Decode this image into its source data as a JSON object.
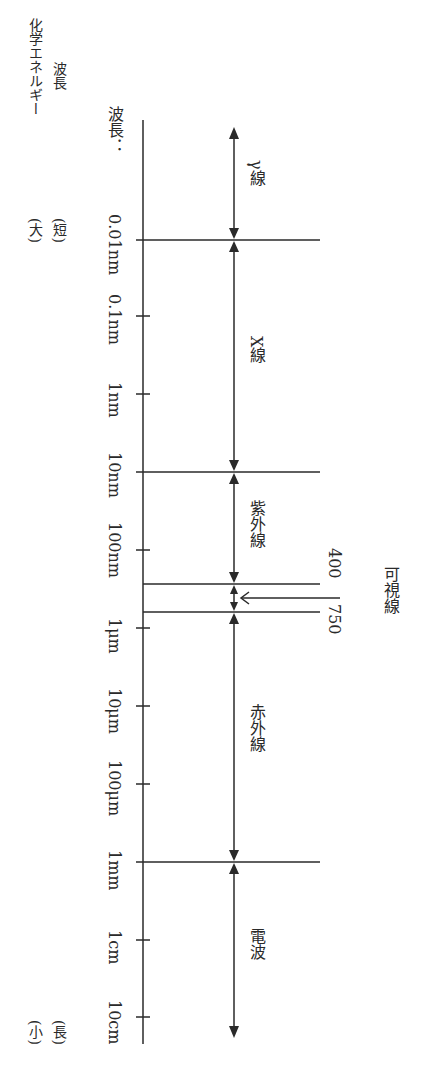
{
  "legend": {
    "line1": "波長",
    "line2": "化学エネルギー",
    "short_label": "(短)",
    "large_label": "(大)",
    "long_label": "(長)",
    "small_label": "(小)"
  },
  "axis": {
    "title": "波長：",
    "ticks": [
      {
        "label": "0.01nm",
        "y": 240
      },
      {
        "label": "0.1nm",
        "y": 316
      },
      {
        "label": "1nm",
        "y": 394
      },
      {
        "label": "10nm",
        "y": 472
      },
      {
        "label": "100nm",
        "y": 550
      },
      {
        "label": "1μm",
        "y": 628
      },
      {
        "label": "10μm",
        "y": 706
      },
      {
        "label": "100μm",
        "y": 784
      },
      {
        "label": "1mm",
        "y": 862
      },
      {
        "label": "1cm",
        "y": 940
      },
      {
        "label": "10cm",
        "y": 1017
      }
    ]
  },
  "regions": [
    {
      "name": "γ線",
      "from": "",
      "to": "0.01nm"
    },
    {
      "name": "X線",
      "from": "0.01nm",
      "to": "10nm"
    },
    {
      "name": "紫外線",
      "from": "10nm",
      "to": "400nm"
    },
    {
      "name": "可視線",
      "from": "400nm",
      "to": "750nm"
    },
    {
      "name": "赤外線",
      "from": "750nm",
      "to": "1mm"
    },
    {
      "name": "電波",
      "from": "1mm",
      "to": ""
    }
  ],
  "visible": {
    "label": "可視線",
    "lower_bound": "400",
    "upper_bound": "750"
  },
  "colors": {
    "line": "#2a2a2a",
    "background": "#ffffff"
  }
}
